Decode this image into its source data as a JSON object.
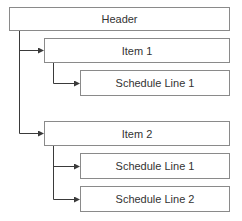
{
  "diagram": {
    "header": {
      "label": "Header"
    },
    "items": [
      {
        "label": "Item 1",
        "schedule_lines": [
          {
            "label": "Schedule Line 1"
          }
        ]
      },
      {
        "label": "Item 2",
        "schedule_lines": [
          {
            "label": "Schedule Line 1"
          },
          {
            "label": "Schedule Line 2"
          }
        ]
      }
    ],
    "colors": {
      "line": "#3a3a3a",
      "box_border": "#8a8a8a",
      "text": "#333333"
    }
  }
}
